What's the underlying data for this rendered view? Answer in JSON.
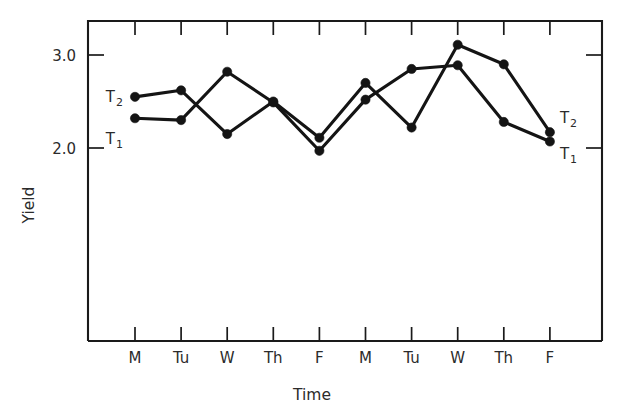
{
  "chart_data": {
    "type": "line",
    "title": "",
    "xlabel": "Time",
    "ylabel": "Yield",
    "categories": [
      "M",
      "Tu",
      "W",
      "Th",
      "F",
      "M",
      "Tu",
      "W",
      "Th",
      "F"
    ],
    "x_tick_labels": [
      "M",
      "Tu",
      "W",
      "Th",
      "F",
      "M",
      "Tu",
      "W",
      "Th",
      "F"
    ],
    "y_tick_labels": [
      "3.0",
      "2.0"
    ],
    "y_tick_values": [
      3.0,
      2.0
    ],
    "ylim": [
      1.57,
      3.33
    ],
    "xlim": [
      0.5,
      10.5
    ],
    "grid": false,
    "legend_position": "inline-endpoints",
    "series": [
      {
        "name": "T1",
        "label": "T",
        "label_sub": "1",
        "values": [
          2.32,
          2.3,
          2.82,
          2.49,
          1.97,
          2.52,
          2.85,
          2.89,
          2.28,
          2.07
        ]
      },
      {
        "name": "T2",
        "label": "T",
        "label_sub": "2",
        "values": [
          2.55,
          2.62,
          2.15,
          2.5,
          2.11,
          2.7,
          2.22,
          3.11,
          2.9,
          2.17
        ]
      }
    ],
    "annotations": [
      {
        "text": "T",
        "sub": "2",
        "position": "left-of-first-point-series-T2"
      },
      {
        "text": "T",
        "sub": "1",
        "position": "left-of-first-point-series-T1"
      },
      {
        "text": "T",
        "sub": "2",
        "position": "right-of-last-point-series-T2"
      },
      {
        "text": "T",
        "sub": "1",
        "position": "right-of-last-point-series-T1"
      }
    ],
    "colors": {
      "line": "#141414",
      "marker": "#141414",
      "axis": "#1a1a1a",
      "text": "#2b2b2b",
      "background": "#ffffff"
    }
  }
}
